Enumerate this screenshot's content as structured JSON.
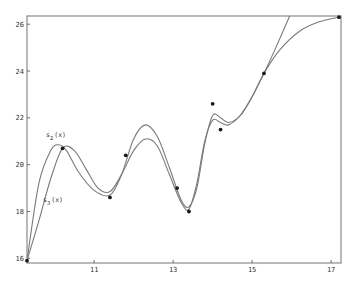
{
  "chart_data": {
    "type": "line",
    "title": "",
    "xlabel": "",
    "ylabel": "",
    "xlim": [
      9.3,
      17.25
    ],
    "ylim": [
      15.8,
      26.35
    ],
    "grid": false,
    "x_ticks": [
      11,
      13,
      15,
      17
    ],
    "x_tick_labels": [
      "11",
      "13",
      "15",
      "17"
    ],
    "y_ticks": [
      16,
      18,
      20,
      22,
      24,
      26
    ],
    "y_tick_labels": [
      "16",
      "18",
      "20",
      "22",
      "24",
      "26"
    ],
    "points": {
      "x": [
        9.3,
        10.2,
        11.4,
        11.8,
        13.1,
        13.4,
        14.0,
        14.2,
        15.3,
        17.2
      ],
      "y": [
        15.9,
        20.7,
        18.6,
        20.4,
        19.0,
        18.0,
        22.6,
        21.5,
        23.9,
        26.3
      ]
    },
    "series": [
      {
        "name": "s2(x)",
        "label_main": "s",
        "label_sub": "2",
        "label_rest": "(x)",
        "x": [
          9.3,
          9.6,
          9.9,
          10.1,
          10.3,
          10.6,
          11.0,
          11.4,
          11.7,
          12.0,
          12.3,
          12.6,
          12.9,
          13.2,
          13.4,
          13.6,
          13.8,
          14.0,
          14.2,
          14.4,
          14.7,
          15.0,
          15.3,
          15.6,
          15.95
        ],
        "values": [
          15.9,
          19.2,
          20.6,
          20.85,
          20.6,
          19.7,
          18.9,
          18.7,
          19.6,
          21.1,
          21.7,
          21.2,
          19.9,
          18.5,
          18.2,
          19.0,
          20.9,
          22.1,
          22.0,
          21.8,
          22.1,
          22.9,
          23.9,
          25.0,
          26.35
        ]
      },
      {
        "name": "s3(x)",
        "label_main": "s",
        "label_sub": "3",
        "label_rest": "(x)",
        "x": [
          9.3,
          9.6,
          9.9,
          10.2,
          10.5,
          10.8,
          11.1,
          11.4,
          11.7,
          12.0,
          12.3,
          12.6,
          12.9,
          13.2,
          13.4,
          13.6,
          13.8,
          14.0,
          14.2,
          14.4,
          14.7,
          15.0,
          15.3,
          15.7,
          16.2,
          16.7,
          17.2
        ],
        "values": [
          15.9,
          17.6,
          19.4,
          20.7,
          20.6,
          19.8,
          19.0,
          18.85,
          19.6,
          20.6,
          21.1,
          20.8,
          19.6,
          18.4,
          18.1,
          19.2,
          21.0,
          21.9,
          21.8,
          21.7,
          22.1,
          22.9,
          23.9,
          24.9,
          25.7,
          26.1,
          26.3
        ]
      }
    ],
    "annotations": [
      {
        "text": "s2(x)",
        "x": 9.8,
        "y": 21.0
      },
      {
        "text": "s3(x)",
        "x": 9.7,
        "y": 18.3
      }
    ]
  }
}
